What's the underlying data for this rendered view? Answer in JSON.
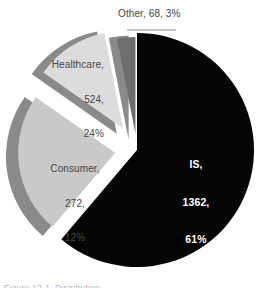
{
  "chart_data": {
    "type": "pie",
    "title": "",
    "subtitle": "",
    "xlabel": "",
    "ylabel": "",
    "legend": "none",
    "grid": false,
    "total": 2226,
    "categories": [
      "IS",
      "Healthcare",
      "Consumer",
      "Other"
    ],
    "values": [
      1362,
      524,
      272,
      68
    ],
    "percentages": [
      61,
      24,
      12,
      3
    ],
    "colors": [
      "#050505",
      "#c9c9c9",
      "#dcdcdc",
      "#6e6e6e"
    ],
    "slices": [
      {
        "name": "IS",
        "value": 1362,
        "percent": 61,
        "color": "#050505",
        "label_text": "IS,\n1362,\n61%",
        "label_line1": "IS,",
        "label_line2": "1362,",
        "label_line3": "61%",
        "label_position": "inside",
        "label_color": "#ffffff",
        "exploded": false
      },
      {
        "name": "Healthcare",
        "value": 524,
        "percent": 24,
        "color": "#c9c9c9",
        "label_text": "Healthcare,\n524,\n24%",
        "label_line1": "Healthcare,",
        "label_line2": "524,",
        "label_line3": "24%",
        "label_position": "outside",
        "label_color": "#454545",
        "exploded": true
      },
      {
        "name": "Consumer",
        "value": 272,
        "percent": 12,
        "color": "#dcdcdc",
        "label_text": "Consumer,\n272,\n12%",
        "label_line1": "Consumer,",
        "label_line2": "272,",
        "label_line3": "12%",
        "label_position": "outside",
        "label_color": "#454545",
        "exploded": true
      },
      {
        "name": "Other",
        "value": 68,
        "percent": 3,
        "color": "#6e6e6e",
        "label_text": "Other, 68, 3%",
        "label_line1": "Other, 68, 3%",
        "label_line2": "",
        "label_line3": "",
        "label_position": "outside",
        "label_color": "#454545",
        "exploded": true
      }
    ],
    "shadow_color": "#8a8a8a"
  },
  "caption": {
    "clipped_text": "Figure 12-1  Distribution"
  }
}
